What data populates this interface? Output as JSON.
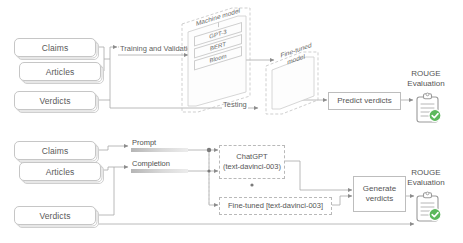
{
  "diagram": {
    "colors": {
      "line": "#9e9e9e",
      "box_border": "#bdbdbd",
      "text": "#555555",
      "check": "#5cb85c",
      "bar": "#b5b5b5"
    }
  },
  "top_pipeline": {
    "inputs": [
      {
        "label": "Claims"
      },
      {
        "label": "Articles"
      },
      {
        "label": "Verdicts"
      }
    ],
    "edge_labels": {
      "training": "Training and Validation",
      "testing": "Testing"
    },
    "model_panel": {
      "title": "Machine model",
      "entries": [
        "GPT-3",
        "BERT",
        "Bloom"
      ]
    },
    "finetuned_panel": {
      "label": "Fine-tuned model"
    },
    "predict_box": {
      "label": "Predict verdicts"
    },
    "evaluation": {
      "caption_line1": "ROUGE",
      "caption_line2": "Evaluation",
      "icon": "clipboard-check-icon"
    }
  },
  "bottom_pipeline": {
    "inputs": [
      {
        "label": "Claims"
      },
      {
        "label": "Articles"
      },
      {
        "label": "Verdicts"
      }
    ],
    "pair_labels": [
      {
        "label": "Prompt"
      },
      {
        "label": "Completion"
      }
    ],
    "models": [
      {
        "name": "ChatGPT",
        "variant": "(text-davinci-003)"
      },
      {
        "name": "Fine-tuned [text-davinci-003]",
        "variant": ""
      }
    ],
    "generate_box": {
      "label_line1": "Generate",
      "label_line2": "verdicts"
    },
    "evaluation": {
      "caption_line1": "ROUGE",
      "caption_line2": "Evaluation",
      "icon": "clipboard-check-icon"
    }
  }
}
